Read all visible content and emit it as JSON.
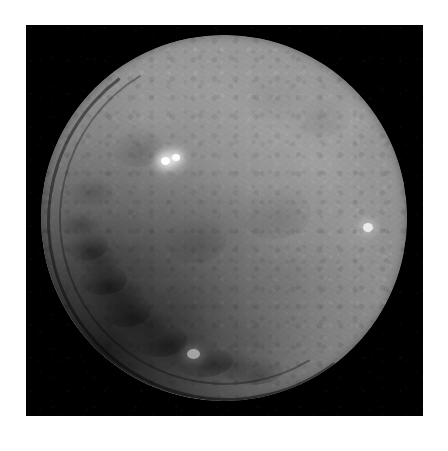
{
  "page": {
    "background_color": "#ffffff",
    "width": 448,
    "height": 451
  },
  "photo": {
    "name": "ceres-dwarf-planet-photograph",
    "alt_text": "Grayscale photograph of the dwarf planet Ceres showing a heavily cratered gray disk against black space",
    "frame_color": "#000000",
    "frame_left": 26,
    "frame_top": 25,
    "frame_width": 397,
    "frame_height": 391,
    "subject": "Ceres",
    "caption": ""
  },
  "colors": {
    "space_black": "#000000",
    "surface_mid_gray": "#8d8d8d",
    "surface_light_gray": "#9a9a9a",
    "surface_shadow_gray": "#3a3a3a",
    "bright_spot_white": "#ffffff",
    "page_white": "#ffffff"
  },
  "disk": {
    "name": "ceres-disk",
    "center_x": 198,
    "center_y": 193,
    "radius": 183,
    "illumination": "lit from upper right, terminator shadow along lower-left limb",
    "limb_darkening": true
  },
  "features": [
    {
      "id": "occator-bright-spots",
      "label": "Occator bright spot pair",
      "type": "bright-spot-cluster",
      "x": 156,
      "y": 144,
      "size": 15,
      "brightness": "very high"
    },
    {
      "id": "occator-spot-primary",
      "label": "Primary bright spot",
      "type": "bright-spot",
      "x": 152,
      "y": 146,
      "size": 8,
      "brightness": "very high"
    },
    {
      "id": "occator-spot-secondary",
      "label": "Secondary bright spot",
      "type": "bright-spot",
      "x": 162,
      "y": 143,
      "size": 7,
      "brightness": "high"
    },
    {
      "id": "right-limb-bright-patch",
      "label": "Right-side bright patch",
      "type": "bright-spot",
      "x": 358,
      "y": 217,
      "size": 9,
      "brightness": "moderate"
    },
    {
      "id": "lower-bright-patch",
      "label": "Lower bright patch",
      "type": "bright-spot",
      "x": 183,
      "y": 343,
      "size": 11,
      "brightness": "moderate"
    },
    {
      "id": "upper-right-light-region",
      "label": "Upper-right light region",
      "type": "albedo-patch",
      "x": 318,
      "y": 110,
      "size": 34,
      "brightness": "low"
    },
    {
      "id": "southwest-cratered-terrain",
      "label": "Southwest heavily cratered terrain",
      "type": "terrain",
      "x": 110,
      "y": 320,
      "size": 150,
      "brightness": "dark"
    },
    {
      "id": "terminator-shadow",
      "label": "Lower-left terminator shadow",
      "type": "shadow",
      "x": 95,
      "y": 355,
      "size": 180,
      "brightness": "very low"
    }
  ]
}
